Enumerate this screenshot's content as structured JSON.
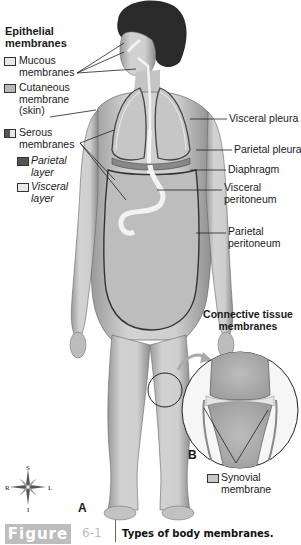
{
  "figure": {
    "label": "Figure",
    "number": "6-1",
    "caption": "Types of body membranes."
  },
  "legend": {
    "heading_line1": "Epithelial",
    "heading_line2": "membranes",
    "items": [
      {
        "lines": [
          "Mucous",
          "membranes"
        ],
        "swatch": "#e8e8e8"
      },
      {
        "lines": [
          "Cutaneous",
          "membrane",
          "(skin)"
        ],
        "swatch": "#b8b8b8"
      },
      {
        "lines": [
          "Serous",
          "membranes"
        ],
        "swatch": "split"
      },
      {
        "lines": [
          "Parietal",
          "layer"
        ],
        "swatch": "#555555",
        "italic": true
      },
      {
        "lines": [
          "Visceral",
          "layer"
        ],
        "swatch": "#e8e8e8",
        "italic": true
      }
    ]
  },
  "right_labels": {
    "visceral_pleura": "Visceral pleura",
    "parietal_pleura": "Parietal pleura",
    "diaphragm": "Diaphragm",
    "visceral_peritoneum_1": "Visceral",
    "visceral_peritoneum_2": "peritoneum",
    "parietal_peritoneum_1": "Parietal",
    "parietal_peritoneum_2": "peritoneum"
  },
  "connective": {
    "heading_line1": "Connective tissue",
    "heading_line2": "membranes",
    "synovial_1": "Synovial",
    "synovial_2": "membrane"
  },
  "panels": {
    "a": "A",
    "b": "B"
  },
  "compass": {
    "s": "S",
    "i": "I",
    "r": "R",
    "l": "L"
  }
}
